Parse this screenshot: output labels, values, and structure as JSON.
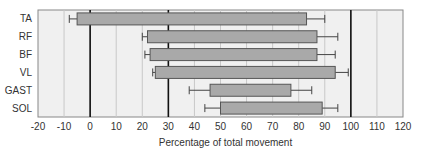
{
  "chart_data": {
    "type": "bar",
    "orientation": "horizontal",
    "title": "",
    "xlabel": "Percentage of total movement",
    "ylabel": "",
    "xlim": [
      -20,
      120
    ],
    "xticks": [
      -20,
      -10,
      0,
      10,
      20,
      30,
      40,
      50,
      60,
      70,
      80,
      90,
      100,
      110,
      120
    ],
    "grid": true,
    "reference_lines": [
      0,
      30,
      100
    ],
    "categories": [
      "TA",
      "RF",
      "BF",
      "VL",
      "GAST",
      "SOL"
    ],
    "series": [
      {
        "name": "activity range",
        "start": [
          -5,
          22,
          23,
          25,
          46,
          50
        ],
        "end": [
          83,
          87,
          87,
          94,
          77,
          89
        ],
        "start_error_min": [
          -8,
          20,
          21,
          24,
          38,
          44
        ],
        "end_error_max": [
          90,
          95,
          94,
          99,
          85,
          95
        ]
      }
    ],
    "colors": {
      "bar_fill": "#a9a9a9",
      "bar_stroke": "#555555",
      "plot_bg": "#f0f0f0",
      "grid": "#c8c8c8",
      "reference_line": "#111111"
    }
  }
}
